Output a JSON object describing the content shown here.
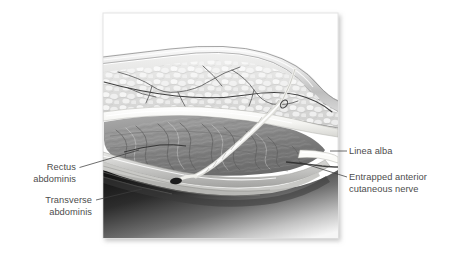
{
  "figure": {
    "panel": {
      "background_color": "#ffffff",
      "border_color": "#e2e2e2",
      "shadow_color": "#b8b8b8"
    },
    "labels": [
      {
        "id": "rectus-abdominis",
        "side": "left",
        "lines": [
          "Rectus",
          "abdominis"
        ],
        "line1": "Rectus",
        "line2": "abdominis"
      },
      {
        "id": "transverse-abdominis",
        "side": "left",
        "lines": [
          "Transverse",
          "abdominis"
        ],
        "line1": "Transverse",
        "line2": "abdominis"
      },
      {
        "id": "linea-alba",
        "side": "right",
        "lines": [
          "Linea alba"
        ],
        "line1": "Linea alba",
        "line2": ""
      },
      {
        "id": "entrapped-anterior-cutaneous-nerve",
        "side": "right",
        "lines": [
          "Entrapped anterior",
          "cutaneous nerve"
        ],
        "line1": "Entrapped anterior",
        "line2": "cutaneous nerve"
      }
    ],
    "anatomy": {
      "layers": [
        "skin",
        "subcutaneous fat",
        "anterior rectus sheath",
        "rectus abdominis",
        "transverse abdominis",
        "linea alba",
        "peritoneal cavity"
      ],
      "nerve_color": "#fdfdfb",
      "muscle_color": "#8d8d8d",
      "fat_color": "#dcdcdc",
      "fascia_color": "#f2f2ef",
      "cavity_color": "#1d1d1d",
      "text_color": "#4d4d4d"
    }
  }
}
